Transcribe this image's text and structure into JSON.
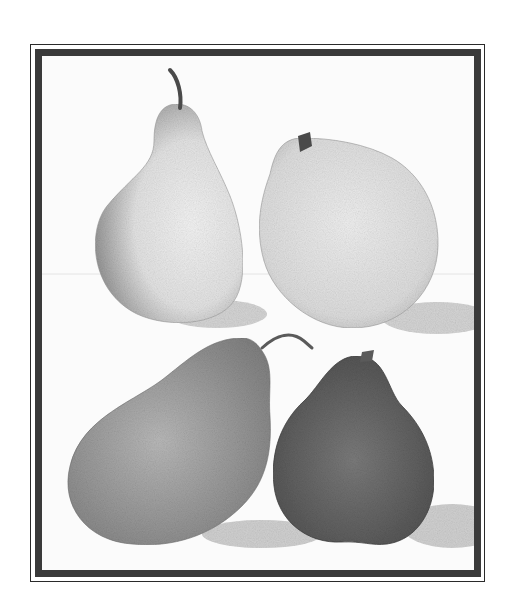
{
  "artwork": {
    "subject": "Four pears, stipple illustration",
    "palette": {
      "frame": "#2e2e2e",
      "background": "#fbfbfb",
      "pear_light": "#e6e6e6",
      "pear_shade": "#8f8f8f",
      "pear_mid": "#9a9a9a",
      "pear_dark": "#5e5e5e",
      "stem": "#4a4a4a",
      "shadow": "#cfcfcf"
    },
    "items": [
      {
        "name": "pear-top-left",
        "tone": "light"
      },
      {
        "name": "pear-top-right",
        "tone": "light"
      },
      {
        "name": "pear-bottom-left",
        "tone": "mid"
      },
      {
        "name": "pear-bottom-right",
        "tone": "dark"
      }
    ]
  }
}
